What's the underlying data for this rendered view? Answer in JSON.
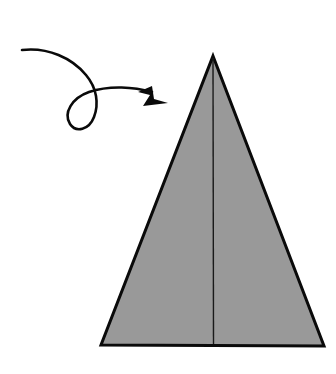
{
  "document": {
    "title": "Origami fold step diagram",
    "background_color": "#ffffff",
    "width": 336,
    "height": 374,
    "caption": ""
  },
  "figure": {
    "name": "triangle-with-curved-arrow",
    "shapes": {
      "triangle": {
        "label": "folded paper triangle",
        "fill_color": "#999999",
        "stroke_color": "#0a0a0a",
        "stroke_width": 3,
        "apex": {
          "x": 213,
          "y": 56
        },
        "bottom_left": {
          "x": 101,
          "y": 345
        },
        "bottom_right": {
          "x": 324,
          "y": 346
        },
        "points": "213,56 324,346 101,345"
      },
      "crease": {
        "label": "vertical center crease line",
        "stroke_color": "#1a1a1a",
        "stroke_width": 1.4,
        "x1": 213,
        "y1": 58,
        "x2": 213.5,
        "y2": 344
      },
      "arrow": {
        "label": "curved looping motion arrow",
        "stroke_color": "#0a0a0a",
        "stroke_width": 2.6,
        "fill_color": "#0a0a0a",
        "tail_start": {
          "x": 22,
          "y": 50
        },
        "tip": {
          "x": 168,
          "y": 103
        },
        "direction": "right",
        "has_loop": true,
        "loop_center": {
          "x": 84,
          "y": 110
        },
        "tail_path": "M22,50 C48,47 72,58 86,75 C97,88 99,104 94,117 C89,130 76,133 70,124 C63,113 72,98 89,92 C110,85 134,87 152,92",
        "head_path": "M152,86 L138,92 L150,95 L143,106 L168,103 L154,99 Z"
      }
    }
  },
  "colors": {
    "paper_gray": "#999999",
    "ink_black": "#0a0a0a",
    "background_white": "#ffffff"
  }
}
